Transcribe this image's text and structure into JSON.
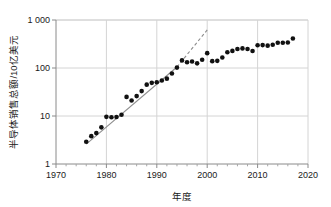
{
  "chart_data": {
    "type": "scatter",
    "title": "",
    "xlabel": "年度",
    "ylabel": "半导体销售总额/10亿美元",
    "xlim": [
      1970,
      2020
    ],
    "ylim": [
      1,
      1000
    ],
    "yscale": "log",
    "grid": true,
    "legend": null,
    "x_ticks": [
      1970,
      1980,
      1990,
      2000,
      2010,
      2020
    ],
    "x_tick_labels": [
      "1970",
      "1980",
      "1990",
      "2000",
      "2010",
      "2020"
    ],
    "x_minor_tick_step": 2,
    "y_ticks": [
      1,
      10,
      100,
      1000
    ],
    "y_tick_labels": [
      "1",
      "10",
      "100",
      "1 000"
    ],
    "marker": {
      "shape": "circle",
      "color": "#111111",
      "size": 4.6
    },
    "x": [
      1976,
      1977,
      1978,
      1979,
      1980,
      1981,
      1982,
      1983,
      1984,
      1985,
      1986,
      1987,
      1988,
      1989,
      1990,
      1991,
      1992,
      1993,
      1994,
      1995,
      1996,
      1997,
      1998,
      1999,
      2000,
      2001,
      2002,
      2003,
      2004,
      2005,
      2006,
      2007,
      2008,
      2009,
      2010,
      2011,
      2012,
      2013,
      2014,
      2015,
      2016,
      2017
    ],
    "y": [
      2.9,
      3.8,
      4.4,
      5.8,
      9.6,
      9.4,
      9.5,
      10.6,
      25.0,
      21.0,
      26.0,
      33.0,
      45.0,
      49.0,
      50.5,
      55.0,
      60.0,
      77.0,
      102.0,
      144.0,
      132.0,
      137.0,
      125.0,
      149.0,
      204.0,
      139.0,
      141.0,
      166.0,
      213.0,
      227.0,
      248.0,
      256.0,
      249.0,
      226.0,
      298.0,
      300.0,
      292.0,
      306.0,
      336.0,
      335.0,
      339.0,
      412.0
    ],
    "trendline": {
      "style_solid": "solid",
      "style_extrapolated": "dashed",
      "color": "#8d8d8d",
      "solid_x": [
        1976,
        1994
      ],
      "solid_y": [
        2.6,
        105
      ],
      "dashed_x": [
        1994,
        2000
      ],
      "dashed_y": [
        105,
        620
      ]
    },
    "annotations": []
  },
  "axes": {
    "y_label": "半导体销售总额/10亿美元",
    "x_label": "年度"
  }
}
